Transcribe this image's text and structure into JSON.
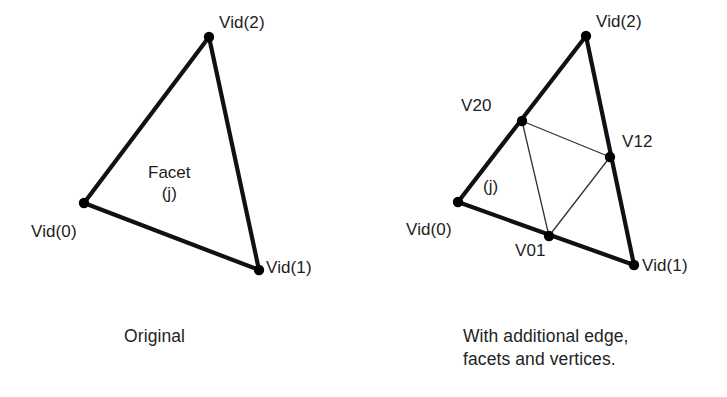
{
  "figure": {
    "background_color": "#ffffff",
    "stroke_color": "#111111",
    "thin_stroke_color": "#333333",
    "vertex_dot_color": "#000000",
    "panels": [
      {
        "id": "original",
        "caption": "Original",
        "caption_position": {
          "x": 124,
          "y": 325
        },
        "triangle": {
          "outer_edge_width": 4.2,
          "vertices": [
            {
              "name": "Vid(0)",
              "x": 84,
              "y": 203,
              "label_x": 31,
              "label_y": 222
            },
            {
              "name": "Vid(1)",
              "x": 259,
              "y": 270,
              "label_x": 266,
              "label_y": 258
            },
            {
              "name": "Vid(2)",
              "x": 209,
              "y": 37,
              "label_x": 219,
              "label_y": 13
            }
          ],
          "edges": [
            {
              "from": "Vid(0)",
              "to": "Vid(1)"
            },
            {
              "from": "Vid(1)",
              "to": "Vid(2)"
            },
            {
              "from": "Vid(2)",
              "to": "Vid(0)"
            }
          ]
        },
        "facet_label": {
          "text": "Facet\n(j)",
          "x": 148,
          "y": 162
        }
      },
      {
        "id": "subdivided",
        "caption": "With additional edge,\nfacets and vertices.",
        "caption_position": {
          "x": 463,
          "y": 325
        },
        "triangle": {
          "outer_edge_width": 4.2,
          "inner_edge_width": 1.3,
          "vertices": [
            {
              "name": "Vid(0)",
              "x": 458,
              "y": 202,
              "label_x": 406,
              "label_y": 220
            },
            {
              "name": "Vid(1)",
              "x": 634,
              "y": 265,
              "label_x": 642,
              "label_y": 256
            },
            {
              "name": "Vid(2)",
              "x": 586,
              "y": 36,
              "label_x": 596,
              "label_y": 12
            },
            {
              "name": "V01",
              "x": 549,
              "y": 236,
              "label_x": 515,
              "label_y": 241
            },
            {
              "name": "V12",
              "x": 610,
              "y": 157,
              "label_x": 622,
              "label_y": 132
            },
            {
              "name": "V20",
              "x": 522,
              "y": 121,
              "label_x": 461,
              "label_y": 96
            }
          ],
          "edges": [
            {
              "from": "Vid(0)",
              "to": "Vid(1)"
            },
            {
              "from": "Vid(1)",
              "to": "Vid(2)"
            },
            {
              "from": "Vid(2)",
              "to": "Vid(0)"
            }
          ],
          "inner_edges": [
            {
              "from": "V20",
              "to": "V12"
            },
            {
              "from": "V12",
              "to": "V01"
            },
            {
              "from": "V01",
              "to": "V20"
            }
          ]
        },
        "facet_label": {
          "text": "(j)",
          "x": 483,
          "y": 176
        }
      }
    ]
  }
}
